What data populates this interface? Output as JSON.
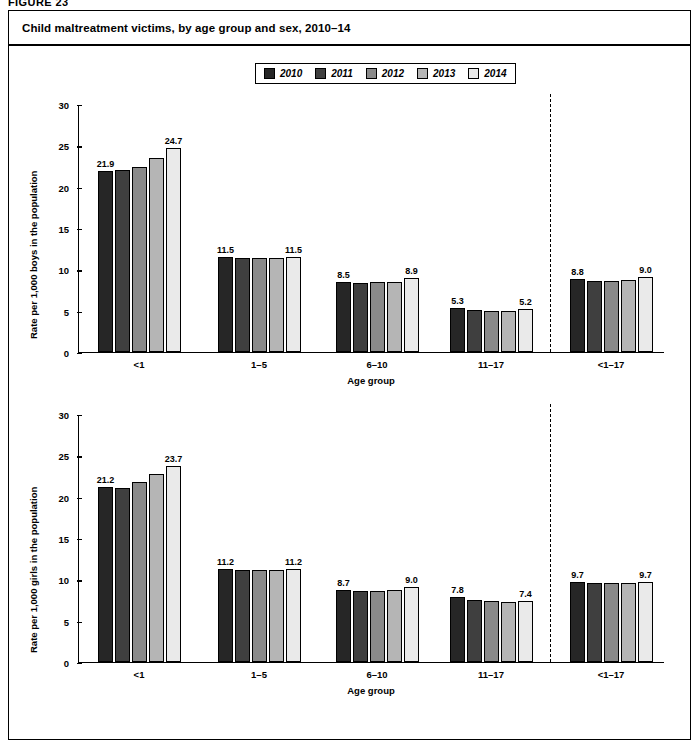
{
  "figure": {
    "label": "FIGURE 23",
    "title": "Child maltreatment victims, by age group and sex, 2010–14"
  },
  "legend": {
    "position": "top-center",
    "entries": [
      {
        "label": "2010",
        "color": "#262626"
      },
      {
        "label": "2011",
        "color": "#3f3f3f"
      },
      {
        "label": "2012",
        "color": "#8a8a8a"
      },
      {
        "label": "2013",
        "color": "#b5b5b5"
      },
      {
        "label": "2014",
        "color": "#eaeaea"
      }
    ]
  },
  "chart_data": [
    {
      "type": "bar",
      "id": "boys",
      "title": "Child maltreatment victims, by age group and sex, 2010–14",
      "subtitle": "",
      "xlabel": "Age group",
      "ylabel": "Rate per 1,000 boys in the population",
      "ylim": [
        0,
        30
      ],
      "yticks": [
        0,
        5,
        10,
        15,
        20,
        25,
        30
      ],
      "grid": false,
      "legend_position": "top-center",
      "categories": [
        "<1",
        "1–5",
        "6–10",
        "11–17",
        "<1–17"
      ],
      "series": [
        {
          "name": "2010",
          "color": "#262626",
          "values": [
            21.9,
            11.5,
            8.5,
            5.3,
            8.8
          ]
        },
        {
          "name": "2011",
          "color": "#3f3f3f",
          "values": [
            22.0,
            11.4,
            8.3,
            5.0,
            8.6
          ]
        },
        {
          "name": "2012",
          "color": "#8a8a8a",
          "values": [
            22.3,
            11.3,
            8.4,
            4.9,
            8.6
          ]
        },
        {
          "name": "2013",
          "color": "#b5b5b5",
          "values": [
            23.4,
            11.4,
            8.5,
            4.9,
            8.7
          ]
        },
        {
          "name": "2014",
          "color": "#eaeaea",
          "values": [
            24.7,
            11.5,
            8.9,
            5.2,
            9.0
          ]
        }
      ],
      "data_labels": [
        {
          "category": "<1",
          "series": "2010",
          "value": "21.9"
        },
        {
          "category": "<1",
          "series": "2014",
          "value": "24.7"
        },
        {
          "category": "1–5",
          "series": "2010",
          "value": "11.5"
        },
        {
          "category": "1–5",
          "series": "2014",
          "value": "11.5"
        },
        {
          "category": "6–10",
          "series": "2010",
          "value": "8.5"
        },
        {
          "category": "6–10",
          "series": "2014",
          "value": "8.9"
        },
        {
          "category": "11–17",
          "series": "2010",
          "value": "5.3"
        },
        {
          "category": "11–17",
          "series": "2014",
          "value": "5.2"
        },
        {
          "category": "<1–17",
          "series": "2010",
          "value": "8.8"
        },
        {
          "category": "<1–17",
          "series": "2014",
          "value": "9.0"
        }
      ],
      "annotations": [
        {
          "type": "vertical-dashed-line",
          "before_category": "<1–17"
        }
      ]
    },
    {
      "type": "bar",
      "id": "girls",
      "title": "",
      "subtitle": "",
      "xlabel": "Age group",
      "ylabel": "Rate per 1,000 girls in the population",
      "ylim": [
        0,
        30
      ],
      "yticks": [
        0,
        5,
        10,
        15,
        20,
        25,
        30
      ],
      "grid": false,
      "legend_position": "top-center",
      "categories": [
        "<1",
        "1–5",
        "6–10",
        "11–17",
        "<1–17"
      ],
      "series": [
        {
          "name": "2010",
          "color": "#262626",
          "values": [
            21.2,
            11.2,
            8.7,
            7.8,
            9.7
          ]
        },
        {
          "name": "2011",
          "color": "#3f3f3f",
          "values": [
            21.0,
            11.1,
            8.6,
            7.5,
            9.5
          ]
        },
        {
          "name": "2012",
          "color": "#8a8a8a",
          "values": [
            21.7,
            11.1,
            8.6,
            7.3,
            9.5
          ]
        },
        {
          "name": "2013",
          "color": "#b5b5b5",
          "values": [
            22.7,
            11.1,
            8.7,
            7.2,
            9.5
          ]
        },
        {
          "name": "2014",
          "color": "#eaeaea",
          "values": [
            23.7,
            11.2,
            9.0,
            7.4,
            9.7
          ]
        }
      ],
      "data_labels": [
        {
          "category": "<1",
          "series": "2010",
          "value": "21.2"
        },
        {
          "category": "<1",
          "series": "2014",
          "value": "23.7"
        },
        {
          "category": "1–5",
          "series": "2010",
          "value": "11.2"
        },
        {
          "category": "1–5",
          "series": "2014",
          "value": "11.2"
        },
        {
          "category": "6–10",
          "series": "2010",
          "value": "8.7"
        },
        {
          "category": "6–10",
          "series": "2014",
          "value": "9.0"
        },
        {
          "category": "11–17",
          "series": "2010",
          "value": "7.8"
        },
        {
          "category": "11–17",
          "series": "2014",
          "value": "7.4"
        },
        {
          "category": "<1–17",
          "series": "2010",
          "value": "9.7"
        },
        {
          "category": "<1–17",
          "series": "2014",
          "value": "9.7"
        }
      ],
      "annotations": [
        {
          "type": "vertical-dashed-line",
          "before_category": "<1–17"
        }
      ]
    }
  ]
}
